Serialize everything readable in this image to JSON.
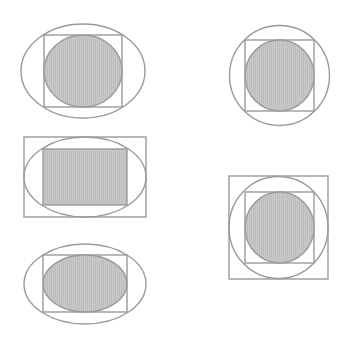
{
  "diagram": {
    "title": "",
    "colors": {
      "background": "#ffffff",
      "stroke": "#9a9a9a",
      "fill": "#c6c6c6",
      "fill_hatch": "#b8b8b8"
    },
    "figures": [
      {
        "id": "figure-1",
        "label": "circle in square in ellipse",
        "outer": {
          "shape": "ellipse",
          "cx": 83,
          "cy": 71,
          "rx": 62,
          "ry": 47
        },
        "middle": {
          "shape": "rect",
          "x": 44,
          "y": 35,
          "w": 78,
          "h": 72
        },
        "inner": {
          "shape": "ellipse",
          "cx": 83,
          "cy": 71,
          "rx": 39,
          "ry": 36,
          "filled": true
        }
      },
      {
        "id": "figure-2",
        "label": "circle in square in circle",
        "outer": {
          "shape": "ellipse",
          "cx": 279.5,
          "cy": 75.5,
          "rx": 50,
          "ry": 50
        },
        "middle": {
          "shape": "rect",
          "x": 245,
          "y": 40,
          "w": 69,
          "h": 71
        },
        "inner": {
          "shape": "ellipse",
          "cx": 279.5,
          "cy": 75.5,
          "rx": 34.5,
          "ry": 35.5,
          "filled": true
        }
      },
      {
        "id": "figure-3",
        "label": "rectangle in ellipse in rectangle",
        "outer": {
          "shape": "rect",
          "x": 24,
          "y": 137,
          "w": 122,
          "h": 80
        },
        "middle": {
          "shape": "ellipse",
          "cx": 85,
          "cy": 177,
          "rx": 61,
          "ry": 40
        },
        "inner": {
          "shape": "rect",
          "x": 43,
          "y": 149,
          "w": 84,
          "h": 56,
          "filled": true
        }
      },
      {
        "id": "figure-4",
        "label": "circle in square in circle in square",
        "outer": {
          "shape": "rect",
          "x": 229,
          "y": 176,
          "w": 99,
          "h": 103
        },
        "middle_outer": {
          "shape": "ellipse",
          "cx": 278.5,
          "cy": 227.5,
          "rx": 49.5,
          "ry": 51
        },
        "middle": {
          "shape": "rect",
          "x": 245,
          "y": 192,
          "w": 69,
          "h": 71
        },
        "inner": {
          "shape": "ellipse",
          "cx": 279.5,
          "cy": 227.5,
          "rx": 34.5,
          "ry": 35.5,
          "filled": true
        }
      },
      {
        "id": "figure-5",
        "label": "ellipse in rectangle in ellipse",
        "outer": {
          "shape": "ellipse",
          "cx": 85,
          "cy": 284,
          "rx": 61,
          "ry": 40
        },
        "middle": {
          "shape": "rect",
          "x": 43,
          "y": 255,
          "w": 84,
          "h": 57
        },
        "inner": {
          "shape": "ellipse",
          "cx": 85,
          "cy": 283.5,
          "rx": 42,
          "ry": 28.5,
          "filled": true
        }
      }
    ]
  }
}
